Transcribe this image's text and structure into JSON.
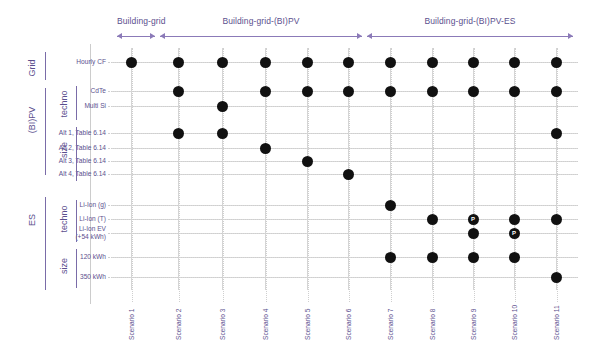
{
  "colors": {
    "label_purple": "#5b4f8e",
    "arrow_purple": "#8b7ab8",
    "dot_black": "#111111",
    "gridline": "#d5d5d5"
  },
  "header_groups": [
    {
      "label": "Building-grid",
      "start_col": 1,
      "end_col": 1
    },
    {
      "label": "Building-grid-(BI)PV",
      "start_col": 2,
      "end_col": 6
    },
    {
      "label": "Building-grid-(BI)PV-ES",
      "start_col": 7,
      "end_col": 11
    }
  ],
  "axis_groups": [
    {
      "level1": "Grid",
      "level2": "",
      "rows": [
        "Hourly CF"
      ]
    },
    {
      "level1": "(BI)PV",
      "level2": "techno",
      "rows": [
        "CdTe",
        "Multi Si"
      ]
    },
    {
      "level1": "(BI)PV",
      "level2": "size",
      "rows": [
        "Alt 1, Table 6.14",
        "Alt 2, Table 6.14",
        "Alt 3, Table 6.14",
        "Alt 4, Table 6.14"
      ]
    },
    {
      "level1": "ES",
      "level2": "techno",
      "rows": [
        "Li-Ion (g)",
        "Li-Ion (T)",
        "Li-Ion EV (+54 kWh)"
      ]
    },
    {
      "level1": "ES",
      "level2": "size",
      "rows": [
        "120 kWh",
        "350 kWh"
      ]
    }
  ],
  "rows": [
    "Hourly CF",
    "CdTe",
    "Multi Si",
    "Alt 1, Table 6.14",
    "Alt 2, Table 6.14",
    "Alt 3, Table 6.14",
    "Alt 4, Table 6.14",
    "Li-Ion (g)",
    "Li-Ion (T)",
    "Li-Ion EV",
    "(+54 kWh)",
    "120 kWh",
    "350 kWh"
  ],
  "columns": [
    "Scenario 1",
    "Scenario 2",
    "Scenario 3",
    "Scenario 4",
    "Scenario 5",
    "Scenario 6",
    "Scenario 7",
    "Scenario 8",
    "Scenario 9",
    "Scenario 10",
    "Scenario 11"
  ],
  "chart_data": {
    "type": "table",
    "xlabel": "",
    "ylabel": "",
    "categories": [
      "Scenario 1",
      "Scenario 2",
      "Scenario 3",
      "Scenario 4",
      "Scenario 5",
      "Scenario 6",
      "Scenario 7",
      "Scenario 8",
      "Scenario 9",
      "Scenario 10",
      "Scenario 11"
    ],
    "row_labels": [
      "Hourly CF",
      "CdTe",
      "Multi Si",
      "Alt 1, Table 6.14",
      "Alt 2, Table 6.14",
      "Alt 3, Table 6.14",
      "Alt 4, Table 6.14",
      "Li-Ion (g)",
      "Li-Ion (T)",
      "Li-Ion EV (+54 kWh)",
      "120 kWh",
      "350 kWh"
    ],
    "marker_legend": {
      "dot": "included in scenario",
      "P": "marker labelled P"
    },
    "markers": [
      {
        "row": "Hourly CF",
        "col": "Scenario 1",
        "type": "dot"
      },
      {
        "row": "Hourly CF",
        "col": "Scenario 2",
        "type": "dot"
      },
      {
        "row": "Hourly CF",
        "col": "Scenario 3",
        "type": "dot"
      },
      {
        "row": "Hourly CF",
        "col": "Scenario 4",
        "type": "dot"
      },
      {
        "row": "Hourly CF",
        "col": "Scenario 5",
        "type": "dot"
      },
      {
        "row": "Hourly CF",
        "col": "Scenario 6",
        "type": "dot"
      },
      {
        "row": "Hourly CF",
        "col": "Scenario 7",
        "type": "dot"
      },
      {
        "row": "Hourly CF",
        "col": "Scenario 8",
        "type": "dot"
      },
      {
        "row": "Hourly CF",
        "col": "Scenario 9",
        "type": "dot"
      },
      {
        "row": "Hourly CF",
        "col": "Scenario 10",
        "type": "dot"
      },
      {
        "row": "Hourly CF",
        "col": "Scenario 11",
        "type": "dot"
      },
      {
        "row": "CdTe",
        "col": "Scenario 2",
        "type": "dot"
      },
      {
        "row": "CdTe",
        "col": "Scenario 4",
        "type": "dot"
      },
      {
        "row": "CdTe",
        "col": "Scenario 5",
        "type": "dot"
      },
      {
        "row": "CdTe",
        "col": "Scenario 6",
        "type": "dot"
      },
      {
        "row": "CdTe",
        "col": "Scenario 7",
        "type": "dot"
      },
      {
        "row": "CdTe",
        "col": "Scenario 8",
        "type": "dot"
      },
      {
        "row": "CdTe",
        "col": "Scenario 9",
        "type": "dot"
      },
      {
        "row": "CdTe",
        "col": "Scenario 10",
        "type": "dot"
      },
      {
        "row": "CdTe",
        "col": "Scenario 11",
        "type": "dot"
      },
      {
        "row": "Multi Si",
        "col": "Scenario 3",
        "type": "dot"
      },
      {
        "row": "Alt 1, Table 6.14",
        "col": "Scenario 2",
        "type": "dot"
      },
      {
        "row": "Alt 1, Table 6.14",
        "col": "Scenario 3",
        "type": "dot"
      },
      {
        "row": "Alt 1, Table 6.14",
        "col": "Scenario 11",
        "type": "dot"
      },
      {
        "row": "Alt 2, Table 6.14",
        "col": "Scenario 4",
        "type": "dot"
      },
      {
        "row": "Alt 3, Table 6.14",
        "col": "Scenario 5",
        "type": "dot"
      },
      {
        "row": "Alt 4, Table 6.14",
        "col": "Scenario 6",
        "type": "dot"
      },
      {
        "row": "Li-Ion (g)",
        "col": "Scenario 7",
        "type": "dot"
      },
      {
        "row": "Li-Ion (T)",
        "col": "Scenario 8",
        "type": "dot"
      },
      {
        "row": "Li-Ion (T)",
        "col": "Scenario 9",
        "type": "P"
      },
      {
        "row": "Li-Ion (T)",
        "col": "Scenario 10",
        "type": "dot"
      },
      {
        "row": "Li-Ion (T)",
        "col": "Scenario 11",
        "type": "dot"
      },
      {
        "row": "Li-Ion EV (+54 kWh)",
        "col": "Scenario 9",
        "type": "dot"
      },
      {
        "row": "Li-Ion EV (+54 kWh)",
        "col": "Scenario 10",
        "type": "P"
      },
      {
        "row": "120 kWh",
        "col": "Scenario 7",
        "type": "dot"
      },
      {
        "row": "120 kWh",
        "col": "Scenario 8",
        "type": "dot"
      },
      {
        "row": "120 kWh",
        "col": "Scenario 9",
        "type": "dot"
      },
      {
        "row": "120 kWh",
        "col": "Scenario 10",
        "type": "dot"
      },
      {
        "row": "350 kWh",
        "col": "Scenario 11",
        "type": "dot"
      }
    ]
  }
}
